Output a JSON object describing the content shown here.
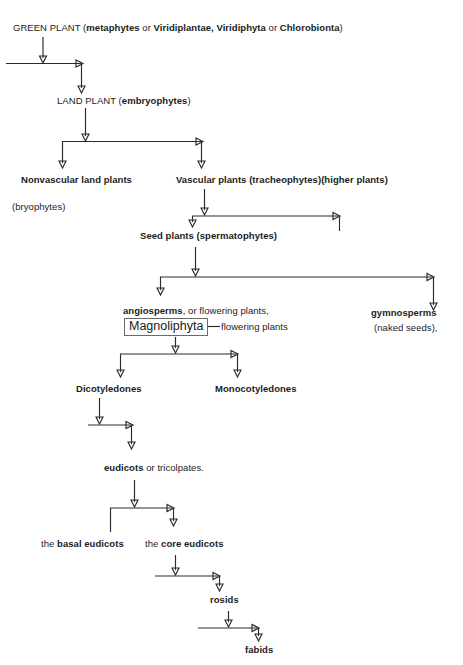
{
  "diagram": {
    "background": "#ffffff",
    "line_color": "#2a2a2a",
    "text_color": "#1c1c1c",
    "nodes": {
      "green_plant": {
        "lead": "GREEN PLANT (",
        "bold1": "metaphytes",
        "mid1": " or ",
        "bold2": "Viridiplantae, Viridiphyta",
        "mid2": " or ",
        "bold3": "Chlorobionta",
        "tail": ")"
      },
      "land_plant": {
        "lead": "LAND PLANT (",
        "bold1": "embryophytes",
        "tail": ")"
      },
      "nonvascular": {
        "bold1": "Nonvascular land plants"
      },
      "bryophytes": {
        "reg1": "(bryophytes)"
      },
      "vascular": {
        "bold1": "Vascular plants (tracheophytes)(higher plants)"
      },
      "seed_plants": {
        "bold1": "Seed plants (spermatophytes)"
      },
      "angiosperms": {
        "bold1": "angiosperms",
        "reg1": ", or flowering plants,"
      },
      "magnoliphyta_box": {
        "label": "Magnoliphyta"
      },
      "flowering_plants": {
        "reg1": "flowering plants"
      },
      "gymnosperms": {
        "bold1": "gymnosperms",
        "reg1": "(naked seeds),"
      },
      "dicotyledones": {
        "bold1": "Dicotyledones"
      },
      "monocotyledones": {
        "bold1": "Monocotyledones"
      },
      "eudicots": {
        "bold1": "eudicots",
        "reg1": " or tricolpates."
      },
      "basal_eudicots": {
        "reg1": "the ",
        "bold1": "basal eudicots"
      },
      "core_eudicots": {
        "reg1": "the ",
        "bold1": "core eudicots"
      },
      "rosids": {
        "bold1": "rosids"
      },
      "fabids": {
        "bold1": "fabids"
      }
    }
  }
}
